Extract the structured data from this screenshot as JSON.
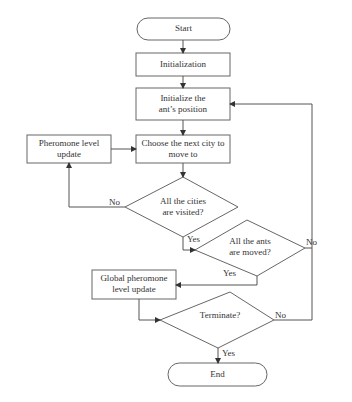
{
  "diagram": {
    "type": "flowchart",
    "nodes": {
      "start": {
        "label": "Start",
        "shape": "terminal"
      },
      "init": {
        "label": "Initialization",
        "shape": "process"
      },
      "init_pos": {
        "line1": "Initialize the",
        "line2": "ant’s position",
        "shape": "process"
      },
      "choose": {
        "line1": "Choose the next city to",
        "line2": "move to",
        "shape": "process"
      },
      "pheromone": {
        "line1": "Pheromone level",
        "line2": "update",
        "shape": "process"
      },
      "cities": {
        "line1": "All the cities",
        "line2": "are visited?",
        "shape": "decision"
      },
      "ants": {
        "line1": "All the ants",
        "line2": "are moved?",
        "shape": "decision"
      },
      "global": {
        "line1": "Global pheromone",
        "line2": "level update",
        "shape": "process"
      },
      "terminate": {
        "label": "Terminate?",
        "shape": "decision"
      },
      "end": {
        "label": "End",
        "shape": "terminal"
      }
    },
    "edge_labels": {
      "cities_no": "No",
      "cities_yes": "Yes",
      "ants_no": "No",
      "ants_yes": "Yes",
      "terminate_no": "No",
      "terminate_yes": "Yes"
    },
    "colors": {
      "stroke": "#555555",
      "text": "#333333",
      "background": "#ffffff"
    }
  }
}
